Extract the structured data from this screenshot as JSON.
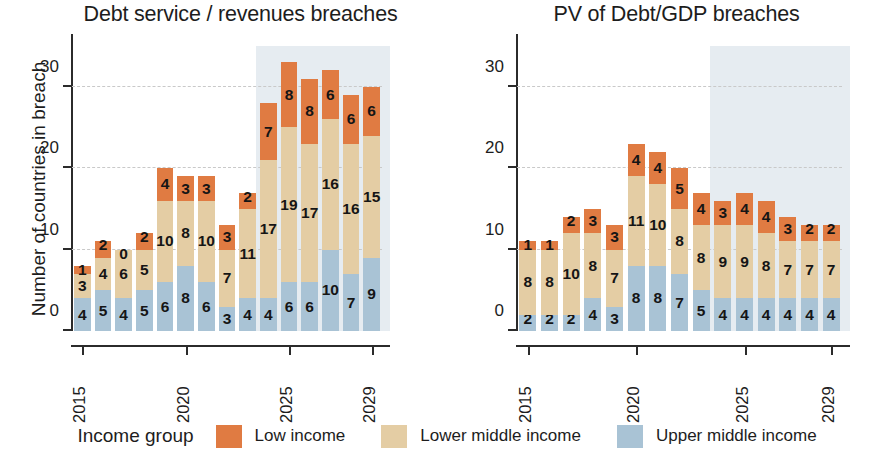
{
  "legend": {
    "title": "Income group",
    "items": [
      {
        "label": "Low income",
        "color": "#e07b42",
        "key": "low"
      },
      {
        "label": "Lower middle income",
        "color": "#e4cda4",
        "key": "lower_middle"
      },
      {
        "label": "Upper middle income",
        "color": "#a9c3d5",
        "key": "upper_middle"
      }
    ]
  },
  "chart_data": [
    {
      "type": "bar",
      "stacked": true,
      "title": "Debt service / revenues breaches",
      "xlabel": "",
      "ylabel": "Number of countries in breach",
      "ylim": [
        0,
        35
      ],
      "yticks": [
        0,
        10,
        20,
        30
      ],
      "grid": true,
      "legend_position": "bottom",
      "x": [
        2015,
        2016,
        2017,
        2018,
        2019,
        2020,
        2021,
        2022,
        2023,
        2024,
        2025,
        2026,
        2027,
        2028,
        2029
      ],
      "xtick_labels": [
        "2015",
        "2020",
        "2025",
        "2029"
      ],
      "xtick_values": [
        2015,
        2020,
        2025,
        2029
      ],
      "forecast_start": 2024,
      "series": [
        {
          "name": "Upper middle income",
          "color": "#a9c3d5",
          "values": [
            4,
            5,
            4,
            5,
            6,
            8,
            6,
            3,
            4,
            4,
            6,
            6,
            10,
            7,
            9
          ]
        },
        {
          "name": "Lower middle income",
          "color": "#e4cda4",
          "values": [
            3,
            4,
            6,
            5,
            10,
            8,
            10,
            7,
            11,
            17,
            19,
            17,
            16,
            16,
            15
          ]
        },
        {
          "name": "Low income",
          "color": "#e07b42",
          "values": [
            1,
            2,
            0,
            2,
            4,
            3,
            3,
            3,
            2,
            7,
            8,
            8,
            6,
            6,
            6
          ]
        }
      ],
      "totals": [
        8,
        11,
        10,
        12,
        20,
        19,
        19,
        13,
        17,
        28,
        33,
        31,
        32,
        29,
        30
      ]
    },
    {
      "type": "bar",
      "stacked": true,
      "title": "PV of Debt/GDP breaches",
      "xlabel": "",
      "ylabel": "Number of countries in breach",
      "ylim": [
        0,
        35
      ],
      "yticks": [
        0,
        10,
        20,
        30
      ],
      "grid": true,
      "legend_position": "bottom",
      "x": [
        2015,
        2016,
        2017,
        2018,
        2019,
        2020,
        2021,
        2022,
        2023,
        2024,
        2025,
        2026,
        2027,
        2028,
        2029
      ],
      "xtick_labels": [
        "2015",
        "2020",
        "2025",
        "2029"
      ],
      "xtick_values": [
        2015,
        2020,
        2025,
        2029
      ],
      "forecast_start": 2024,
      "series": [
        {
          "name": "Upper middle income",
          "color": "#a9c3d5",
          "values": [
            2,
            2,
            2,
            4,
            3,
            8,
            8,
            7,
            5,
            4,
            4,
            4,
            4,
            4,
            4
          ]
        },
        {
          "name": "Lower middle income",
          "color": "#e4cda4",
          "values": [
            8,
            8,
            10,
            8,
            7,
            11,
            10,
            8,
            8,
            9,
            9,
            8,
            7,
            7,
            7
          ]
        },
        {
          "name": "Low income",
          "color": "#e07b42",
          "values": [
            1,
            1,
            2,
            3,
            3,
            4,
            4,
            5,
            4,
            3,
            4,
            4,
            3,
            2,
            2
          ]
        }
      ],
      "totals": [
        11,
        11,
        14,
        15,
        13,
        23,
        22,
        20,
        17,
        16,
        17,
        16,
        14,
        13,
        13
      ]
    }
  ]
}
